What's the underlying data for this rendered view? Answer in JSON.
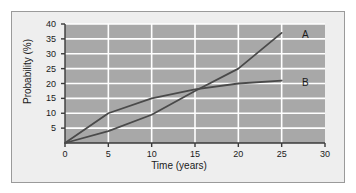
{
  "figure": {
    "background_color": "#eeeeee",
    "plot_background_color": "#a8a8a8",
    "gridline_color": "#ffffff",
    "axis_color": "#3a3a3a",
    "curve_color": "#4a4a4a"
  },
  "chart_data": {
    "type": "line",
    "title": "",
    "xlabel": "Time (years)",
    "ylabel": "Probability (%)",
    "xlim": [
      0,
      30
    ],
    "ylim": [
      0,
      40
    ],
    "xticks": [
      0,
      5,
      10,
      15,
      20,
      25,
      30
    ],
    "yticks": [
      5,
      10,
      15,
      20,
      25,
      30,
      35,
      40
    ],
    "xtick_labels": [
      "0",
      "5",
      "10",
      "15",
      "20",
      "25",
      "30"
    ],
    "ytick_labels": [
      "5",
      "10",
      "15",
      "20",
      "25",
      "30",
      "35",
      "40"
    ],
    "grid": true,
    "grid_axis": "both",
    "legend": "inline-end-labels",
    "series": [
      {
        "name": "A",
        "label": "A",
        "label_x": 26.2,
        "label_y": 37.0,
        "x": [
          0,
          5,
          10,
          15,
          20,
          25
        ],
        "values": [
          0,
          4,
          9.5,
          17.5,
          25,
          37
        ]
      },
      {
        "name": "B",
        "label": "B",
        "label_x": 26.2,
        "label_y": 21.0,
        "x": [
          0,
          5,
          10,
          15,
          20,
          25
        ],
        "values": [
          0,
          10,
          15,
          18,
          20,
          21
        ]
      }
    ]
  }
}
